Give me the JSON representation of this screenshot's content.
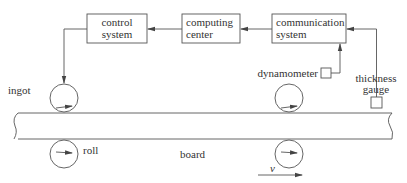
{
  "diagram": {
    "blocks": [
      {
        "id": "control",
        "line1": "control",
        "line2": "system"
      },
      {
        "id": "computing",
        "line1": "computing",
        "line2": "center"
      },
      {
        "id": "communication",
        "line1": "communication",
        "line2": "system"
      }
    ],
    "labels": {
      "ingot": "ingot",
      "roll": "roll",
      "board": "board",
      "dynamometer": "dynamometer",
      "thickness_line1": "thickness",
      "thickness_line2": "gauge",
      "velocity": "v"
    },
    "flow": [
      "thickness gauge -> communication system",
      "dynamometer -> communication system",
      "communication system -> computing center",
      "computing center -> control system",
      "control system -> ingot roll"
    ]
  }
}
